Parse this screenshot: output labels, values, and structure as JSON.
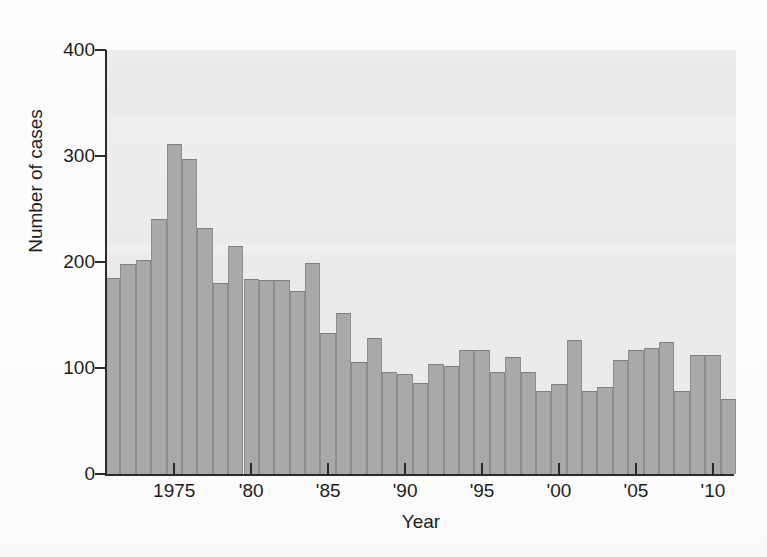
{
  "chart_data": {
    "type": "bar",
    "title": "",
    "xlabel": "Year",
    "ylabel": "Number of cases",
    "ylim": [
      0,
      400
    ],
    "ytick_values": [
      0,
      100,
      200,
      300,
      400
    ],
    "ytick_labels": [
      "0",
      "100",
      "200",
      "300",
      "400"
    ],
    "xtick_values": [
      1975,
      1980,
      1985,
      1990,
      1995,
      2000,
      2005,
      2010
    ],
    "xtick_labels": [
      "1975",
      "'80",
      "'85",
      "'90",
      "'95",
      "'00",
      "'05",
      "'10"
    ],
    "xlim": [
      1971,
      2012
    ],
    "grid": false,
    "legend": null,
    "bar_color": "#a9a9a9",
    "bar_edge_color": "#8d8d8d",
    "plot_background": "#ececec",
    "categories": [
      1971,
      1972,
      1973,
      1974,
      1975,
      1976,
      1977,
      1978,
      1979,
      1980,
      1981,
      1982,
      1983,
      1984,
      1985,
      1986,
      1987,
      1988,
      1989,
      1990,
      1991,
      1992,
      1993,
      1994,
      1995,
      1996,
      1997,
      1998,
      1999,
      2000,
      2001,
      2002,
      2003,
      2004,
      2005,
      2006,
      2007,
      2008,
      2009,
      2010,
      2011
    ],
    "values": [
      185,
      198,
      202,
      241,
      311,
      297,
      232,
      180,
      215,
      184,
      183,
      183,
      173,
      199,
      133,
      152,
      106,
      128,
      96,
      94,
      86,
      104,
      102,
      117,
      117,
      96,
      110,
      96,
      78,
      85,
      126,
      78,
      82,
      108,
      117,
      119,
      125,
      78,
      112,
      112,
      71
    ]
  },
  "ghost_text": {
    "top_line": "",
    "mid_line": ""
  }
}
